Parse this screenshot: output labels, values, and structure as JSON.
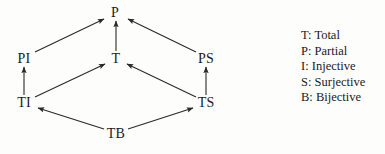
{
  "diagram": {
    "type": "hasse-diagram",
    "nodes": [
      {
        "id": "P",
        "label": "P",
        "x": 115,
        "y": 13
      },
      {
        "id": "PI",
        "label": "PI",
        "x": 24,
        "y": 59
      },
      {
        "id": "T",
        "label": "T",
        "x": 116,
        "y": 59
      },
      {
        "id": "PS",
        "label": "PS",
        "x": 206,
        "y": 59
      },
      {
        "id": "TI",
        "label": "TI",
        "x": 24,
        "y": 103
      },
      {
        "id": "TS",
        "label": "TS",
        "x": 206,
        "y": 103
      },
      {
        "id": "TB",
        "label": "TB",
        "x": 116,
        "y": 134
      }
    ],
    "edges": [
      {
        "from": "PI",
        "to": "P",
        "x1": 35,
        "y1": 52,
        "x2": 104,
        "y2": 19
      },
      {
        "from": "T",
        "to": "P",
        "x1": 116,
        "y1": 51,
        "x2": 116,
        "y2": 21
      },
      {
        "from": "PS",
        "to": "P",
        "x1": 196,
        "y1": 52,
        "x2": 128,
        "y2": 19
      },
      {
        "from": "TI",
        "to": "PI",
        "x1": 24,
        "y1": 95,
        "x2": 24,
        "y2": 67
      },
      {
        "from": "TI",
        "to": "T",
        "x1": 35,
        "y1": 97,
        "x2": 105,
        "y2": 64
      },
      {
        "from": "TS",
        "to": "T",
        "x1": 196,
        "y1": 97,
        "x2": 127,
        "y2": 64
      },
      {
        "from": "TS",
        "to": "PS",
        "x1": 206,
        "y1": 95,
        "x2": 206,
        "y2": 67
      },
      {
        "from": "TB",
        "to": "TI",
        "x1": 104,
        "y1": 129,
        "x2": 38,
        "y2": 108
      },
      {
        "from": "TB",
        "to": "TS",
        "x1": 128,
        "y1": 129,
        "x2": 193,
        "y2": 108
      }
    ],
    "stroke_color": "#2a2a2a",
    "text_color": "#1b1b1b",
    "background_color": "#fdfdfc"
  },
  "legend": {
    "items": [
      {
        "key": "T",
        "text": "T: Total"
      },
      {
        "key": "P",
        "text": "P: Partial"
      },
      {
        "key": "I",
        "text": "I: Injective"
      },
      {
        "key": "S",
        "text": "S: Surjective"
      },
      {
        "key": "B",
        "text": "B: Bijective"
      }
    ]
  }
}
